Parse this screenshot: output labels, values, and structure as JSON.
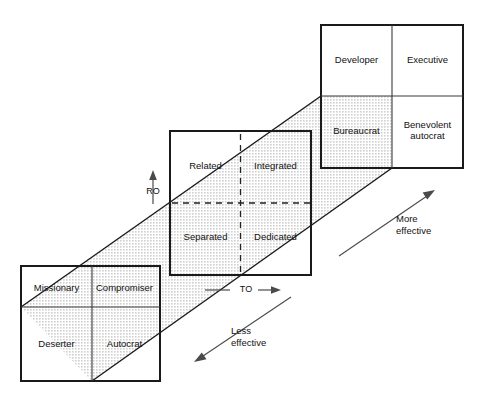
{
  "diagram": {
    "title_hidden": "",
    "colors": {
      "shade": "#e6e6e6",
      "stroke": "#1a1a1a",
      "thin_stroke": "#3a3a3a",
      "arrow": "#4a4a4a",
      "text": "#111111",
      "background": "#ffffff"
    },
    "grids": [
      {
        "name": "bottom-left-grid",
        "cells": [
          {
            "label": "Missionary",
            "pos": "top-left"
          },
          {
            "label": "Compromiser",
            "pos": "top-right"
          },
          {
            "label": "Deserter",
            "pos": "bottom-left"
          },
          {
            "label": "Autocrat",
            "pos": "bottom-right"
          }
        ],
        "divider_style": "solid"
      },
      {
        "name": "middle-grid",
        "cells": [
          {
            "label": "Related",
            "pos": "top-left"
          },
          {
            "label": "Integrated",
            "pos": "top-right"
          },
          {
            "label": "Separated",
            "pos": "bottom-left"
          },
          {
            "label": "Dedicated",
            "pos": "bottom-right"
          }
        ],
        "divider_style": "dashed"
      },
      {
        "name": "top-right-grid",
        "cells": [
          {
            "label": "Developer",
            "pos": "top-left"
          },
          {
            "label": "Executive",
            "pos": "top-right"
          },
          {
            "label": "Bureaucrat",
            "pos": "bottom-left"
          },
          {
            "label": "Benevolent\nautocrat",
            "pos": "bottom-right"
          }
        ],
        "divider_style": "solid"
      }
    ],
    "axes": [
      {
        "name": "ro-axis",
        "label": "RO",
        "direction": "up"
      },
      {
        "name": "to-axis",
        "label": "TO",
        "direction": "right"
      }
    ],
    "annotations": [
      {
        "name": "more-effective",
        "label": "More\neffective",
        "direction": "up-right"
      },
      {
        "name": "less-effective",
        "label": "Less\neffective",
        "direction": "down-left"
      }
    ]
  }
}
